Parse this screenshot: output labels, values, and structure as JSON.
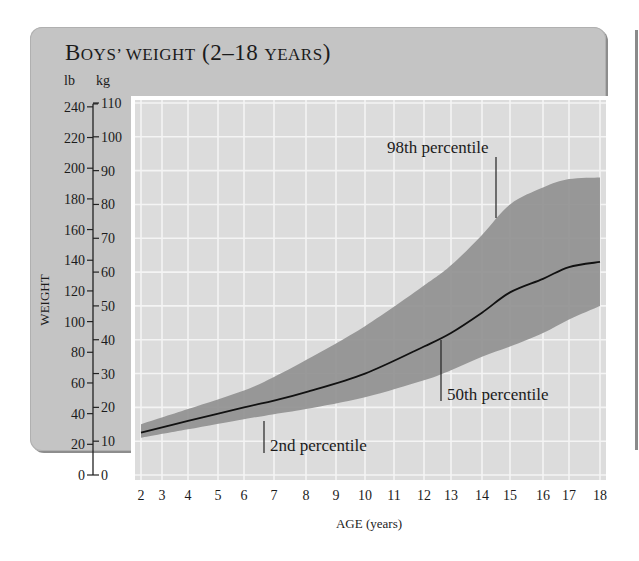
{
  "title": {
    "lead": "B",
    "rest_caps": "OYS’ WEIGHT",
    "paren_open": " (2–18 ",
    "years_caps": "YEARS",
    "paren_close": ")"
  },
  "units": {
    "lb": "lb",
    "kg": "kg"
  },
  "colors": {
    "panel": "#c4c4c4",
    "plot_bg": "#dcdcdc",
    "grid": "#f4f4f4",
    "band": "#8f8f8f",
    "median_line": "#111111",
    "frame": "#ffffff"
  },
  "chart_data": {
    "type": "area",
    "title": "Boys’ weight (2–18 years)",
    "xlabel": "AGE (years)",
    "ylabel": "WEIGHT",
    "y_units": [
      "lb",
      "kg"
    ],
    "xlim": [
      2,
      18
    ],
    "ylim_kg": [
      0,
      110
    ],
    "ylim_lb": [
      0,
      240
    ],
    "grid": true,
    "legend": "inline annotations",
    "x_ticks": [
      2,
      3,
      4,
      5,
      6,
      7,
      8,
      9,
      10,
      11,
      12,
      13,
      14,
      15,
      16,
      17,
      18
    ],
    "y_ticks_lb": [
      0,
      20,
      40,
      60,
      80,
      100,
      120,
      140,
      160,
      180,
      200,
      220,
      240
    ],
    "y_ticks_kg": [
      0,
      10,
      20,
      30,
      40,
      50,
      60,
      70,
      80,
      90,
      100,
      110
    ],
    "x": [
      2,
      4,
      6,
      7,
      8,
      10,
      12,
      13,
      14,
      15,
      16,
      17,
      18
    ],
    "series": [
      {
        "name": "98th percentile",
        "role": "band_upper",
        "unit": "kg",
        "values": [
          15,
          19.5,
          25,
          29,
          34,
          44,
          56,
          62,
          71,
          80,
          85,
          87.5,
          88
        ]
      },
      {
        "name": "50th percentile",
        "role": "line",
        "unit": "kg",
        "values": [
          12.5,
          16,
          20,
          22,
          24.5,
          30,
          38,
          42,
          48,
          54,
          58,
          61.5,
          63
        ]
      },
      {
        "name": "2nd percentile",
        "role": "band_lower",
        "unit": "kg",
        "values": [
          11,
          13.5,
          16.5,
          18,
          19.5,
          23,
          28,
          31,
          35,
          38,
          42,
          46,
          50
        ]
      }
    ],
    "annotations": [
      {
        "text": "98th percentile",
        "points_to_age": 14.5
      },
      {
        "text": "50th percentile",
        "points_to_age": 13.2
      },
      {
        "text": "2nd percentile",
        "points_to_age": 6.6
      }
    ]
  },
  "labels": {
    "anno_98": "98th percentile",
    "anno_50": "50th percentile",
    "anno_2": "2nd percentile",
    "xlabel": "AGE (years)",
    "ylabel": "WEIGHT"
  }
}
